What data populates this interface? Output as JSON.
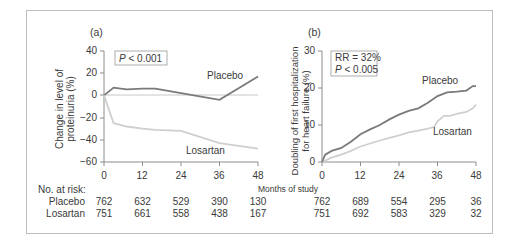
{
  "chart_data": [
    {
      "type": "line",
      "panel_label": "(a)",
      "title": "",
      "xlabel": "Months of study",
      "ylabel": "Change in level of proteinuria (%)",
      "xticks": [
        0,
        12,
        24,
        36,
        48
      ],
      "yticks": [
        40,
        20,
        0,
        -20,
        -40,
        -60
      ],
      "xlim": [
        0,
        48
      ],
      "ylim": [
        -60,
        40
      ],
      "grid": false,
      "reference_line_y": 0,
      "annotation": "P < 0.001",
      "series": [
        {
          "name": "Placebo",
          "color": "#7a7a7a",
          "x": [
            0,
            3,
            7,
            12,
            16,
            24,
            36,
            48
          ],
          "y": [
            0,
            7,
            5.5,
            6,
            6,
            2,
            -4,
            17
          ]
        },
        {
          "name": "Losartan",
          "color": "#cfcfcf",
          "x": [
            0,
            3,
            7,
            12,
            16,
            24,
            36,
            48
          ],
          "y": [
            0,
            -25,
            -28,
            -30,
            -31,
            -32,
            -43,
            -48
          ]
        }
      ]
    },
    {
      "type": "line",
      "panel_label": "(b)",
      "title": "",
      "xlabel": "Months of study",
      "ylabel": "Doubling of first hospitalization for heart failure (%)",
      "xticks": [
        0,
        12,
        24,
        36,
        48
      ],
      "yticks": [
        0,
        10,
        20,
        30
      ],
      "xlim": [
        0,
        48
      ],
      "ylim": [
        0,
        30
      ],
      "grid": false,
      "annotation": "RR = 32%\nP < 0.005",
      "series": [
        {
          "name": "Placebo",
          "color": "#7a7a7a",
          "x": [
            0,
            1,
            3,
            6,
            9,
            12,
            15,
            18,
            21,
            24,
            27,
            30,
            33,
            36,
            39,
            42,
            45,
            47,
            48
          ],
          "y": [
            0,
            2,
            3,
            3.8,
            5.5,
            7.5,
            8.8,
            10,
            11.5,
            12.8,
            13.8,
            14.5,
            16,
            17.8,
            18.8,
            19,
            19.3,
            20.5,
            20.5
          ]
        },
        {
          "name": "Losartan",
          "color": "#cfcfcf",
          "x": [
            0,
            3,
            6,
            9,
            12,
            15,
            18,
            21,
            24,
            27,
            30,
            33,
            35,
            36,
            38,
            40,
            42,
            45,
            47,
            48
          ],
          "y": [
            0,
            1.2,
            2,
            3,
            4.2,
            5,
            5.8,
            6.5,
            7.2,
            8,
            8.5,
            9,
            9.5,
            11,
            12.5,
            12.5,
            13,
            13.5,
            14.5,
            15.5
          ]
        }
      ]
    }
  ],
  "labels": {
    "panel_a": "(a)",
    "panel_b": "(b)",
    "a_ylabel_1": "Change in level of",
    "a_ylabel_2": "proteinuria (%)",
    "b_ylabel_1": "Doubling of first hospitalization",
    "b_ylabel_2": "for heart failure (%)",
    "a_pvalue_prefix": "P",
    "a_pvalue_rest": " < 0.001",
    "b_rr": "RR = 32%",
    "b_pvalue_prefix": "P",
    "b_pvalue_rest": " < 0.005",
    "a_placebo": "Placebo",
    "a_losartan": "Losartan",
    "b_placebo": "Placebo",
    "b_losartan": "Losartan",
    "xlabel": "Months of study"
  },
  "ticks": {
    "a_y": [
      "40",
      "20",
      "0",
      "−20",
      "−40",
      "−60"
    ],
    "b_y": [
      "30",
      "20",
      "10",
      "0"
    ],
    "x": [
      "0",
      "12",
      "24",
      "36",
      "48"
    ]
  },
  "at_risk": {
    "header": "No. at risk:",
    "rows": [
      {
        "label": "Placebo",
        "a": [
          "762",
          "632",
          "529",
          "390",
          "130"
        ],
        "b": [
          "762",
          "689",
          "554",
          "295",
          "36"
        ]
      },
      {
        "label": "Losartan",
        "a": [
          "751",
          "661",
          "558",
          "438",
          "167"
        ],
        "b": [
          "751",
          "692",
          "583",
          "329",
          "32"
        ]
      }
    ]
  }
}
